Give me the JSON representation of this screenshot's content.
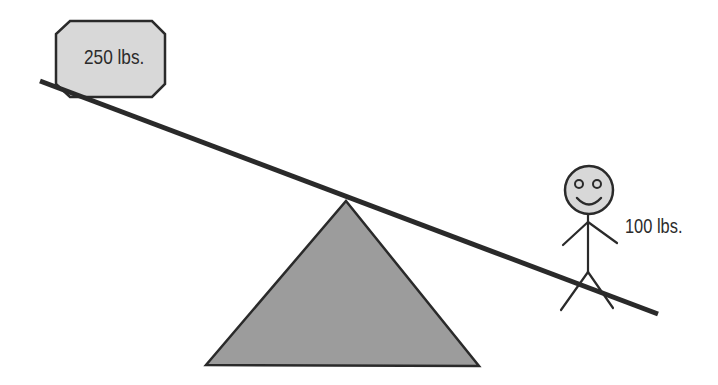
{
  "diagram": {
    "type": "lever-seesaw",
    "colors": {
      "background": "#ffffff",
      "stroke": "#2a2a2a",
      "fulcrum_fill": "#9c9c9c",
      "light_fill": "#d8d8d8",
      "text": "#2b2b2b"
    },
    "heavy_weight": {
      "shape": "octagon",
      "label": "250 lbs.",
      "position": "left end of lever"
    },
    "light_weight": {
      "shape": "stick-figure",
      "label": "100 lbs.",
      "position": "right end of lever"
    },
    "lever": {
      "description": "Board tilted down to the right, resting on fulcrum"
    },
    "fulcrum": {
      "shape": "triangle"
    }
  }
}
